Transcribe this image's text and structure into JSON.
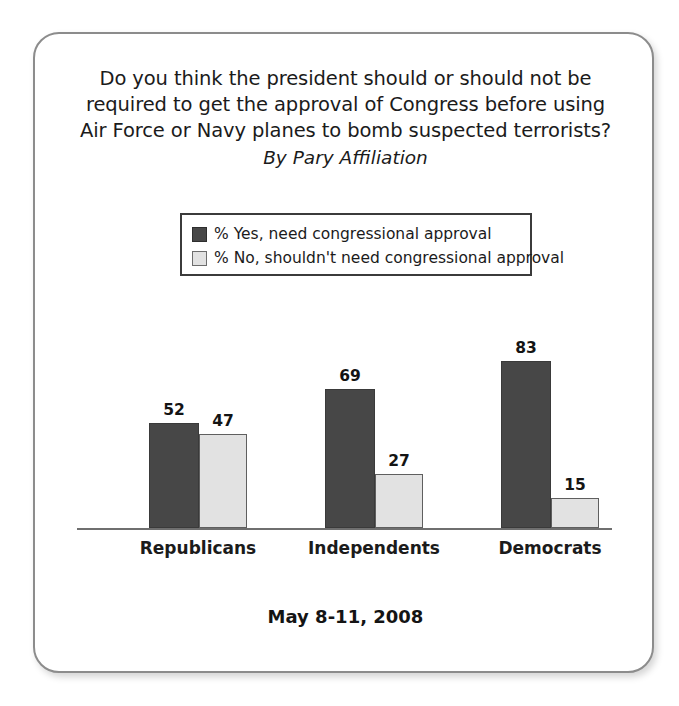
{
  "chart_data": {
    "type": "bar",
    "title": "Do you think the president should or should not be required to get the approval of Congress before using Air Force or Navy planes to bomb suspected terrorists?",
    "title_lines": [
      "Do you think the president should or should not be",
      "required to get the approval of Congress before using",
      "Air Force or Navy planes to bomb suspected terrorists?"
    ],
    "subtitle": "By Pary Affiliation",
    "categories": [
      "Republicans",
      "Independents",
      "Democrats"
    ],
    "series": [
      {
        "name": "% Yes, need congressional approval",
        "color": "#474747",
        "values": [
          52,
          69,
          83
        ]
      },
      {
        "name": "% No, shouldn't need congressional approval",
        "color": "#e2e2e2",
        "values": [
          47,
          27,
          15
        ]
      }
    ],
    "xlabel": "",
    "ylabel": "",
    "ylim": [
      0,
      100
    ],
    "grid": false,
    "legend_position": "top-center",
    "value_labels": true,
    "footer": "May 8-11, 2008"
  },
  "frame": {
    "border_color": "#8c8c8c",
    "background": "#ffffff"
  }
}
